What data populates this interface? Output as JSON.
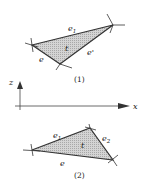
{
  "figure": {
    "panel1": {
      "caption": "(1)",
      "labels": {
        "top_edge": "e",
        "top_edge_sub": "1",
        "center": "t",
        "right_edge": "e'",
        "bottom_edge": "e"
      }
    },
    "axes": {
      "vertical": "z",
      "horizontal": "x"
    },
    "panel2": {
      "caption": "(2)",
      "labels": {
        "left_edge": "e",
        "left_edge_sub": "1",
        "center": "t",
        "right_edge": "e",
        "right_edge_sub": "2",
        "bottom_edge": "e"
      }
    },
    "colors": {
      "fill": "#c8c8c8",
      "stroke": "#333333"
    }
  }
}
